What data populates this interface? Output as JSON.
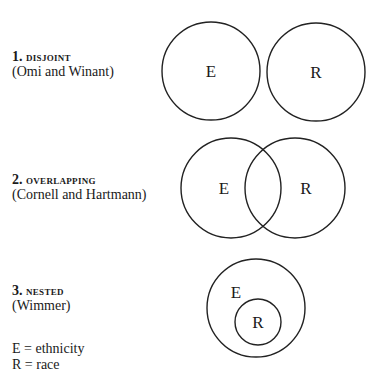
{
  "diagrams": [
    {
      "number": "1.",
      "title": "DISJOINT",
      "citation": "(Omi and Winant)",
      "circles": [
        {
          "label": "E",
          "cx": 211,
          "cy": 71,
          "r": 49,
          "label_x": 211,
          "label_y": 77
        },
        {
          "label": "R",
          "cx": 316,
          "cy": 72,
          "r": 49,
          "label_x": 316,
          "label_y": 78
        }
      ]
    },
    {
      "number": "2.",
      "title": "OVERLAPPING",
      "citation": "(Cornell and Hartmann)",
      "circles": [
        {
          "label": "E",
          "cx": 231,
          "cy": 188,
          "r": 50,
          "label_x": 224,
          "label_y": 194
        },
        {
          "label": "R",
          "cx": 295,
          "cy": 188,
          "r": 50,
          "label_x": 306,
          "label_y": 194
        }
      ]
    },
    {
      "number": "3.",
      "title": "NESTED",
      "citation": "(Wimmer)",
      "circles": [
        {
          "label": "E",
          "cx": 256,
          "cy": 308,
          "r": 49,
          "label_x": 236,
          "label_y": 298
        },
        {
          "label": "R",
          "cx": 258,
          "cy": 322,
          "r": 23,
          "label_x": 258,
          "label_y": 328
        }
      ]
    }
  ],
  "legend": [
    "E = ethnicity",
    "R = race"
  ]
}
